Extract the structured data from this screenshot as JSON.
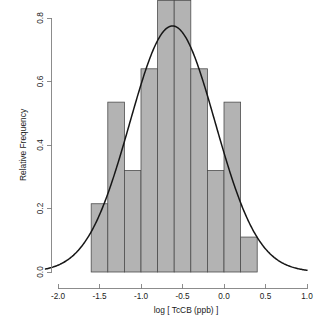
{
  "chart_data": {
    "type": "bar",
    "title": "",
    "subtitle": "",
    "xlabel": "log [ TcCB (ppb) ]",
    "ylabel": "Relative Frequency",
    "xlim": [
      -2.15,
      1.05
    ],
    "ylim": [
      0.0,
      0.885
    ],
    "grid": false,
    "legend": null,
    "xticks": [
      -2.0,
      -1.5,
      -1.0,
      -0.5,
      0.0,
      0.5,
      1.0
    ],
    "xtick_labels": [
      "-2.0",
      "-1.5",
      "-1.0",
      "-0.5",
      "0.0",
      "0.5",
      "1.0"
    ],
    "yticks": [
      0.0,
      0.2,
      0.4,
      0.6,
      0.8
    ],
    "ytick_labels": [
      "0.0",
      "0.2",
      "0.4",
      "0.6",
      "0.8"
    ],
    "bin_width": 0.2,
    "bin_edges": [
      -1.6,
      -1.4,
      -1.2,
      -1.0,
      -0.8,
      -0.6,
      -0.4,
      -0.2,
      0.0,
      0.2,
      0.4
    ],
    "categories": [
      "-1.6 to -1.4",
      "-1.4 to -1.2",
      "-1.2 to -1.0",
      "-1.0 to -0.8",
      "-0.8 to -0.6",
      "-0.6 to -0.4",
      "-0.4 to -0.2",
      "-0.2 to 0.0",
      "0.0 to 0.2",
      "0.2 to 0.4"
    ],
    "values": [
      0.215,
      0.535,
      0.32,
      0.64,
      0.855,
      0.855,
      0.64,
      0.32,
      0.535,
      0.11
    ],
    "series": [
      {
        "name": "Relative Frequency",
        "type": "bar",
        "values": [
          0.215,
          0.535,
          0.32,
          0.64,
          0.855,
          0.855,
          0.64,
          0.32,
          0.535,
          0.11
        ]
      },
      {
        "name": "Normal density",
        "type": "line",
        "mean": -0.62,
        "sd": 0.515,
        "peak_y": 0.775,
        "x_start": -2.15,
        "x_end": 1.0
      }
    ],
    "bar_fill_color": "#b3b3b3",
    "bar_border_color": "#4d4d4d",
    "curve_color": "#161616",
    "axis_color": "#808080"
  },
  "axes": {
    "x_axis_name": "x-axis",
    "y_axis_name": "y-axis"
  }
}
